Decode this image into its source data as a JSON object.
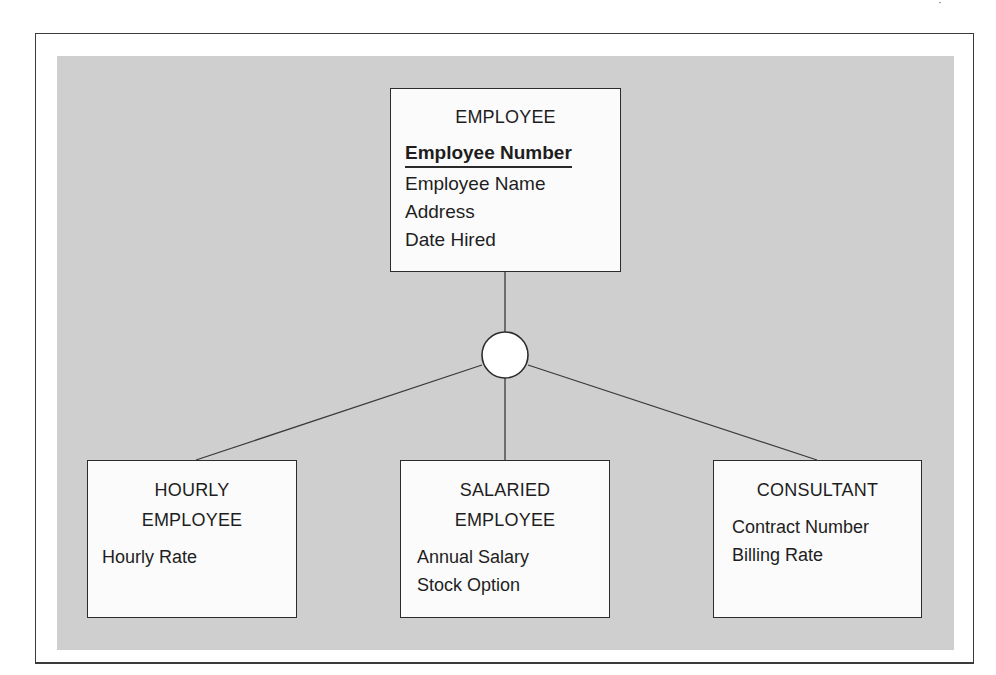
{
  "diagram": {
    "type": "EER supertype/subtype hierarchy",
    "colors": {
      "panel": "#cfcfcf",
      "entity_fill": "#fbfbfb",
      "line": "#3a3a3a"
    },
    "supertype": {
      "name": "EMPLOYEE",
      "identifier": "Employee Number",
      "attributes": [
        "Employee Name",
        "Address",
        "Date Hired"
      ]
    },
    "subtype_symbol": "circle",
    "subtypes": [
      {
        "name": "HOURLY\nEMPLOYEE",
        "attributes": [
          "Hourly Rate"
        ]
      },
      {
        "name": "SALARIED\nEMPLOYEE",
        "attributes": [
          "Annual Salary",
          "Stock Option"
        ]
      },
      {
        "name": "CONSULTANT",
        "attributes": [
          "Contract Number",
          "Billing Rate"
        ]
      }
    ]
  }
}
